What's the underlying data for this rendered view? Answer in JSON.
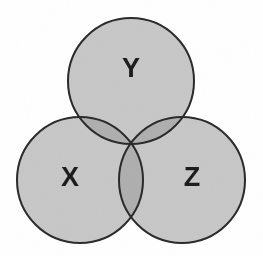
{
  "figure": {
    "kind": "venn-diagram",
    "background_color": "#ffffff",
    "width": 263,
    "height": 256
  },
  "style": {
    "fill_color": "#c8c8c8",
    "overlap_color": "#b0b0b0",
    "triple_overlap_color": "#a9a9a9",
    "stroke_color": "#2b2b2b",
    "stroke_width": 2,
    "label_color": "#1d1d1d",
    "label_font_size": 27
  },
  "sets": [
    {
      "id": "Y",
      "label": "Y",
      "cx": 131,
      "cy": 81,
      "r": 63,
      "label_x": 131,
      "label_y": 70
    },
    {
      "id": "X",
      "label": "X",
      "cx": 80,
      "cy": 180,
      "r": 63,
      "label_x": 70,
      "label_y": 179
    },
    {
      "id": "Z",
      "label": "Z",
      "cx": 182,
      "cy": 180,
      "r": 63,
      "label_x": 192,
      "label_y": 179
    }
  ],
  "regions": [
    {
      "id": "X-only",
      "sets": [
        "X"
      ],
      "shade": "base",
      "label": ""
    },
    {
      "id": "Y-only",
      "sets": [
        "Y"
      ],
      "shade": "base",
      "label": ""
    },
    {
      "id": "Z-only",
      "sets": [
        "Z"
      ],
      "shade": "base",
      "label": ""
    },
    {
      "id": "XY",
      "sets": [
        "X",
        "Y"
      ],
      "shade": "double",
      "label": ""
    },
    {
      "id": "YZ",
      "sets": [
        "Y",
        "Z"
      ],
      "shade": "double",
      "label": ""
    },
    {
      "id": "XZ",
      "sets": [
        "X",
        "Z"
      ],
      "shade": "double",
      "label": ""
    },
    {
      "id": "XYZ",
      "sets": [
        "X",
        "Y",
        "Z"
      ],
      "shade": "triple",
      "label": ""
    }
  ]
}
